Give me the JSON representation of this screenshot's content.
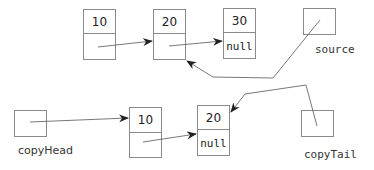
{
  "source_list": {
    "nodes": [
      {
        "data": "10",
        "next": ""
      },
      {
        "data": "20",
        "next": ""
      },
      {
        "data": "30",
        "next": "null"
      }
    ],
    "pointer": {
      "label": "source",
      "points_to": "node 20"
    }
  },
  "copy_list": {
    "nodes": [
      {
        "data": "10",
        "next": ""
      },
      {
        "data": "20",
        "next": "null"
      }
    ],
    "head_pointer": {
      "label": "copyHead",
      "points_to": "node 10"
    },
    "tail_pointer": {
      "label": "copyTail",
      "points_to": "node 20"
    }
  },
  "colors": {
    "box_stroke": "#8a8a8a",
    "arrow": "#555555",
    "text": "#222222"
  }
}
